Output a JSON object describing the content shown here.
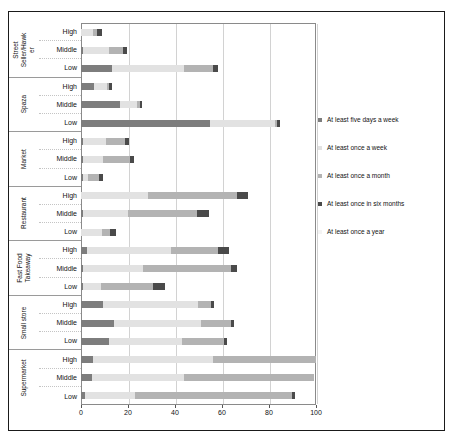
{
  "chart_data": {
    "type": "bar",
    "orientation": "horizontal",
    "stacked": true,
    "title": "",
    "xlabel": "",
    "ylabel": "",
    "xlim": [
      0,
      100
    ],
    "xticks": [
      0,
      20,
      40,
      60,
      80,
      100
    ],
    "xtick_labels": [
      "0",
      "20",
      "40",
      "60",
      "80",
      "100"
    ],
    "grid": true,
    "legend_position": "right",
    "legend": [
      "At least five days a week",
      "At least once a week",
      "At least once a month",
      "At least once in six months",
      "At least once a year"
    ],
    "series_colors": [
      "#7d7d7d",
      "#e2e2e2",
      "#b3b3b3",
      "#4a4a4a",
      "#f4f4f4"
    ],
    "income_levels": [
      "High",
      "Middle",
      "Low"
    ],
    "groups": [
      {
        "name": "Street Seller/Hawker",
        "label_lines": [
          "Street",
          "Seller/Hawk",
          "er"
        ],
        "rows": [
          {
            "level": "High",
            "values": [
              0.0,
              5.0,
              2.0,
              2.0,
              0.0
            ]
          },
          {
            "level": "Middle",
            "values": [
              1.0,
              11.0,
              6.0,
              1.5,
              0.0
            ]
          },
          {
            "level": "Low",
            "values": [
              13.0,
              31.0,
              12.0,
              2.5,
              0.0
            ]
          }
        ]
      },
      {
        "name": "Spaza",
        "label_lines": [
          "Spaza"
        ],
        "rows": [
          {
            "level": "High",
            "values": [
              5.5,
              5.5,
              1.0,
              1.0,
              0.0
            ]
          },
          {
            "level": "Middle",
            "values": [
              16.5,
              7.5,
              1.0,
              1.0,
              0.0
            ]
          },
          {
            "level": "Low",
            "values": [
              55.0,
              27.5,
              1.0,
              1.0,
              0.0
            ]
          }
        ]
      },
      {
        "name": "Market",
        "label_lines": [
          "Market"
        ],
        "rows": [
          {
            "level": "High",
            "values": [
              0.8,
              10.0,
              8.0,
              1.5,
              0.0
            ]
          },
          {
            "level": "Middle",
            "values": [
              0.8,
              8.5,
              11.5,
              1.8,
              0.0
            ]
          },
          {
            "level": "Low",
            "values": [
              0.8,
              2.0,
              5.0,
              1.5,
              0.0
            ]
          }
        ]
      },
      {
        "name": "Restaurant",
        "label_lines": [
          "Restaurant"
        ],
        "rows": [
          {
            "level": "High",
            "values": [
              0.0,
              28.5,
              38.0,
              4.5,
              0.0
            ]
          },
          {
            "level": "Middle",
            "values": [
              0.8,
              19.0,
              29.5,
              5.0,
              0.0
            ]
          },
          {
            "level": "Low",
            "values": [
              0.0,
              9.0,
              3.5,
              2.5,
              0.0
            ]
          }
        ]
      },
      {
        "name": "Fast Food Takeaway",
        "label_lines": [
          "Fast Food",
          "Takeaway"
        ],
        "rows": [
          {
            "level": "High",
            "values": [
              2.5,
              36.0,
              20.0,
              4.5,
              0.0
            ]
          },
          {
            "level": "Middle",
            "values": [
              1.0,
              25.5,
              37.5,
              2.5,
              0.0
            ]
          },
          {
            "level": "Low",
            "values": [
              0.8,
              7.5,
              22.5,
              5.0,
              0.0
            ]
          }
        ]
      },
      {
        "name": "Small store",
        "label_lines": [
          "Small store"
        ],
        "rows": [
          {
            "level": "High",
            "values": [
              9.5,
              40.5,
              5.5,
              1.0,
              0.0
            ]
          },
          {
            "level": "Middle",
            "values": [
              14.0,
              37.0,
              13.0,
              1.0,
              0.0
            ]
          },
          {
            "level": "Low",
            "values": [
              12.0,
              31.0,
              18.0,
              1.0,
              0.0
            ]
          }
        ]
      },
      {
        "name": "Supermarket",
        "label_lines": [
          "Supermarket"
        ],
        "rows": [
          {
            "level": "High",
            "values": [
              5.0,
              51.0,
              44.0,
              0.0,
              0.0
            ]
          },
          {
            "level": "Middle",
            "values": [
              4.5,
              39.5,
              55.0,
              0.0,
              0.0
            ]
          },
          {
            "level": "Low",
            "values": [
              1.5,
              21.5,
              67.0,
              1.0,
              0.0
            ]
          }
        ]
      }
    ]
  }
}
